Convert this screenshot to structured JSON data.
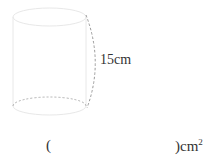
{
  "figure": {
    "shape": "cylinder",
    "height_label": "15cm",
    "stroke_color": "#e6e6e6",
    "dash_color": "#9a9a9a"
  },
  "answer": {
    "open_paren": "(",
    "close_paren": ")",
    "unit": "cm",
    "unit_exponent": "2"
  }
}
